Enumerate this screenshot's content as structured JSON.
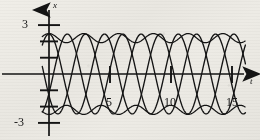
{
  "figure": {
    "title": "",
    "background_color": "#ecebe5",
    "ink_color": "#141414"
  },
  "axes": {
    "y_axis_label": "x",
    "x_axis_label": "t",
    "y_ticks_labeled": [
      {
        "value": 3,
        "label": "3"
      },
      {
        "value": -3,
        "label": "-3"
      }
    ],
    "y_ticks_unlabeled": [
      2,
      1,
      -1,
      -2
    ],
    "x_ticks_labeled": [
      {
        "value": 5,
        "label": "5"
      },
      {
        "value": 10,
        "label": "10"
      },
      {
        "value": 15,
        "label": "15"
      }
    ],
    "origin_px": {
      "x": 49,
      "y": 74
    },
    "x_scale_px_per_unit": 12.2,
    "y_scale_px_per_unit": 16.3,
    "xlim": [
      -1,
      16.5
    ],
    "ylim": [
      -3.8,
      3.8
    ],
    "grid": false,
    "arrowheads": [
      "x-axis-right",
      "y-axis-top"
    ]
  },
  "chart_data": {
    "type": "line",
    "title": "",
    "xlabel": "t",
    "ylabel": "x",
    "xlim": [
      -1,
      16.5
    ],
    "ylim": [
      -3.8,
      3.8
    ],
    "grid": false,
    "legend": "none",
    "series": [
      {
        "name": "envelope-upper",
        "kind": "envelope",
        "formula": "2.20 + 0.28*cos(2*pi*t/2.85)",
        "mean": 2.2,
        "ripple_amplitude": 0.28,
        "ripple_period": 2.85,
        "values": [
          2.48,
          2.05,
          1.96,
          2.34,
          2.47,
          2.12,
          1.94,
          2.26,
          2.46,
          2.2,
          1.94,
          2.18,
          2.44,
          2.27,
          1.95,
          2.1,
          2.4
        ]
      },
      {
        "name": "envelope-lower",
        "kind": "envelope",
        "formula": "-2.20 - 0.28*cos(2*pi*t/2.85)",
        "mean": -2.2,
        "ripple_amplitude": 0.28,
        "ripple_period": 2.85,
        "values": [
          -2.48,
          -2.05,
          -1.96,
          -2.34,
          -2.47,
          -2.12,
          -1.94,
          -2.26,
          -2.46,
          -2.2,
          -1.94,
          -2.18,
          -2.44,
          -2.27,
          -1.95,
          -2.1,
          -2.4
        ]
      },
      {
        "name": "oscillation-a",
        "kind": "carrier",
        "formula": "2.45*cos(2*pi*t/4.55)",
        "amplitude": 2.45,
        "period": 4.55,
        "phase": 0.0
      },
      {
        "name": "oscillation-b",
        "kind": "carrier",
        "formula": "2.45*cos(2*pi*(t-1.5)/4.55)",
        "amplitude": 2.45,
        "period": 4.55,
        "phase": 1.5
      },
      {
        "name": "oscillation-c",
        "kind": "carrier",
        "formula": "2.45*cos(2*pi*(t-3.0)/4.55)",
        "amplitude": 2.45,
        "period": 4.55,
        "phase": 3.0
      }
    ]
  }
}
